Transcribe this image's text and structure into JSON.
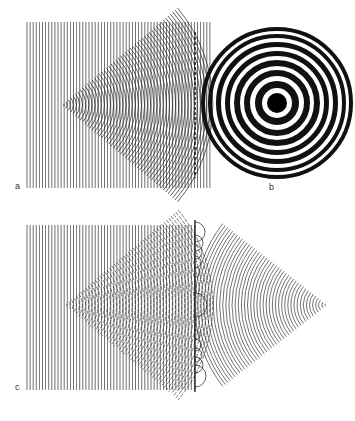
{
  "figure": {
    "panels": [
      {
        "id": "a",
        "label": "a",
        "description": "Plane waves (parallel vertical lines) with a diverging fan of circular wavefronts from a point source"
      },
      {
        "id": "b",
        "label": "b",
        "description": "Zone plate: concentric black and white rings with a solid black center"
      },
      {
        "id": "c",
        "label": "c",
        "description": "Plane waves passing a zone plate and converging to a focal point, with Huygens wavelets at the plate"
      }
    ]
  },
  "colors": {
    "ink": "#222222",
    "background": "#ffffff"
  },
  "geometry": {
    "a": {
      "x0": 27,
      "x1": 212,
      "y0": 22,
      "y1": 188,
      "line_spacing": 3.1,
      "apex": [
        62,
        105
      ],
      "fan_half_angle_deg": 40,
      "arc_spacing": 3.1
    },
    "b": {
      "cx": 277,
      "cy": 103,
      "center_dot_r": 10,
      "rings": [
        [
          15,
          22
        ],
        [
          27,
          33
        ],
        [
          37,
          43
        ],
        [
          47,
          52
        ],
        [
          56,
          61
        ],
        [
          65,
          69
        ],
        [
          72,
          76
        ]
      ]
    },
    "c": {
      "x0": 27,
      "x1": 195,
      "y0": 225,
      "y1": 390,
      "line_spacing": 3.1,
      "apex_left": [
        65,
        305
      ],
      "plate_x": 195,
      "apex_right": [
        327,
        305
      ]
    }
  }
}
